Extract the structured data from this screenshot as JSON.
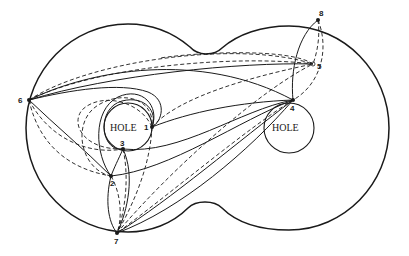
{
  "diagram": {
    "type": "graph-on-surface",
    "holes": [
      {
        "id": "hole-left",
        "label": "HOLE",
        "cx": 128,
        "cy": 127,
        "r": 24
      },
      {
        "id": "hole-right",
        "label": "HOLE",
        "cx": 289,
        "cy": 128,
        "r": 25
      }
    ],
    "nodes": [
      {
        "id": "1",
        "label": "1",
        "x": 152,
        "y": 127
      },
      {
        "id": "2",
        "label": "2",
        "x": 111,
        "y": 176
      },
      {
        "id": "3",
        "label": "3",
        "x": 123,
        "y": 149
      },
      {
        "id": "4",
        "label": "4",
        "x": 293,
        "y": 100
      },
      {
        "id": "5",
        "label": "5",
        "x": 313,
        "y": 64
      },
      {
        "id": "6",
        "label": "6",
        "x": 29,
        "y": 100
      },
      {
        "id": "7",
        "label": "7",
        "x": 117,
        "y": 233
      },
      {
        "id": "8",
        "label": "8",
        "x": 318,
        "y": 20
      }
    ],
    "edge_styles": [
      "solid",
      "dashed"
    ]
  }
}
